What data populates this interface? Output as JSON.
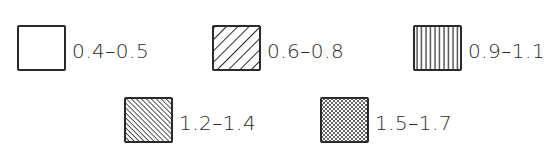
{
  "legend": {
    "items": [
      {
        "label": "0.4–0.5",
        "pattern": "blank"
      },
      {
        "label": "0.6–0.8",
        "pattern": "diagonal-hatch-wide"
      },
      {
        "label": "0.9–1.1",
        "pattern": "vertical-lines"
      },
      {
        "label": "1.2–1.4",
        "pattern": "diagonal-hatch-dense"
      },
      {
        "label": "1.5–1.7",
        "pattern": "crosshatch"
      }
    ],
    "colors": {
      "ink": "#2a2a2a",
      "background": "#ffffff"
    }
  }
}
